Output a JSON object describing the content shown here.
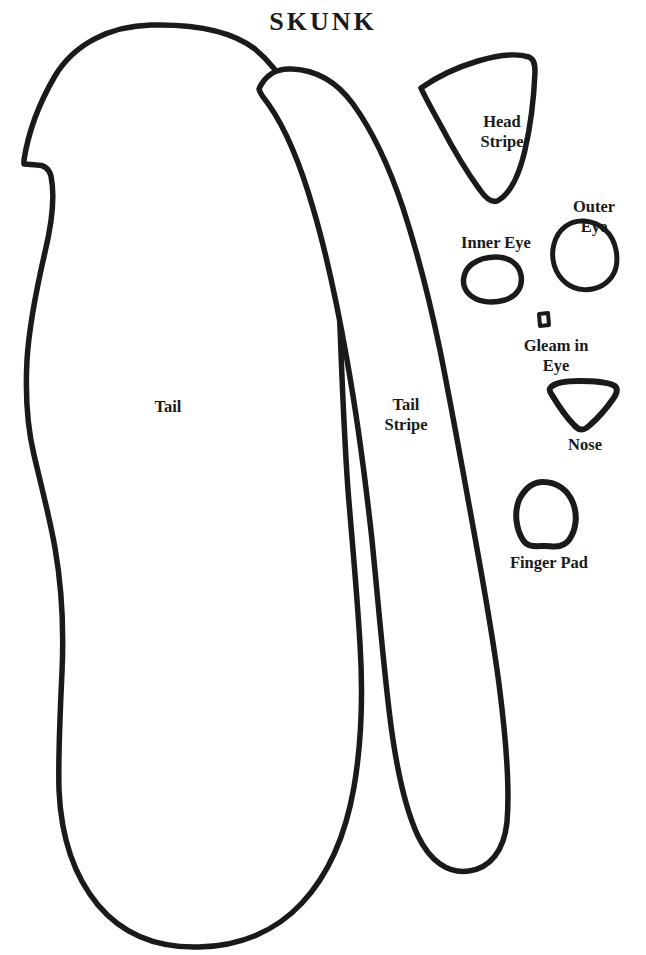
{
  "page": {
    "title": "SKUNK",
    "background_color": "#ffffff",
    "ink_color": "#1a1a1a",
    "width": 646,
    "height": 955
  },
  "pieces": [
    {
      "id": "tail",
      "label": "Tail",
      "label_x": 168,
      "label_y": 397,
      "stroke_width": 5.5,
      "icon": "tail-outline-shape",
      "path": "M 151 25 C 110 26 74 44 55 76 C 38 105 28 134 24 160 L 24 164 L 37 165 C 44 165 49 169 51 176 C 55 196 52 223 45 252 C 36 291 29 327 27 360 C 25 398 28 430 34 455 C 42 489 50 519 55 548 C 62 588 64 628 62 672 C 60 716 58 754 59 790 C 61 836 74 876 98 905 C 124 936 160 948 199 947 C 240 946 276 931 302 903 C 330 873 346 833 354 787 C 362 740 363 692 360 644 C 357 592 352 540 348 490 C 344 434 342 380 340 327 C 338 262 332 205 318 160 C 303 110 283 72 255 49 C 229 29 190 24 151 25 Z"
    },
    {
      "id": "tail-stripe",
      "label": "Tail\nStripe",
      "label_x": 406,
      "label_y": 395,
      "stroke_width": 5.5,
      "icon": "tail-stripe-outline-shape",
      "path": "M 259 89 C 265 75 277 68 292 69 C 316 70 337 82 353 104 C 374 133 390 169 403 208 C 418 254 430 302 440 350 C 452 410 462 466 472 521 C 482 576 492 630 499 684 C 506 738 510 786 507 822 C 504 851 490 868 469 871 C 448 874 430 861 418 836 C 404 806 396 766 390 718 C 383 661 378 600 372 540 C 365 476 357 416 347 360 C 337 303 326 252 313 208 C 300 163 285 128 269 105 C 264 98 260 94 259 89 Z"
    },
    {
      "id": "head-stripe",
      "label": "Head\nStripe",
      "label_x": 502,
      "label_y": 112,
      "stroke_width": 5.5,
      "icon": "head-stripe-outline-shape",
      "path": "M 421 88 C 438 76 458 67 478 61 C 498 55 516 53 529 57 C 534 59 535 64 535 72 C 534 96 531 124 525 150 C 519 176 510 193 499 200 C 493 204 487 200 480 190 C 466 171 452 147 440 124 C 430 106 424 95 421 88 Z"
    },
    {
      "id": "outer-eye",
      "label": "Outer Eye",
      "label_x": 594,
      "label_y": 197,
      "stroke_width": 5,
      "icon": "outer-eye-outline-shape",
      "path": "M 584 221 C 601 222 613 234 616 250 C 619 266 614 278 603 285 C 591 292 576 291 566 283 C 555 274 550 259 554 244 C 558 229 570 220 584 221 Z"
    },
    {
      "id": "inner-eye",
      "label": "Inner Eye",
      "label_x": 496,
      "label_y": 233,
      "stroke_width": 5.5,
      "icon": "inner-eye-outline-shape",
      "path": "M 496 257 C 509 257 519 264 521 275 C 523 287 517 296 505 300 C 491 304 476 302 468 293 C 461 285 462 272 472 264 C 479 259 488 257 496 257 Z"
    },
    {
      "id": "gleam-in-eye",
      "label": "Gleam in Eye",
      "label_x": 556,
      "label_y": 336,
      "stroke_width": 4,
      "icon": "gleam-in-eye-outline-shape",
      "path": "M 539 314 L 548 313 L 549 325 L 540 326 Z"
    },
    {
      "id": "nose",
      "label": "Nose",
      "label_x": 585,
      "label_y": 435,
      "stroke_width": 6,
      "icon": "nose-outline-shape",
      "path": "M 551 387 C 556 382 566 381 579 381 C 593 381 606 382 613 385 C 618 387 618 392 613 399 C 606 409 597 419 590 425 C 584 431 579 431 574 425 C 566 417 558 405 552 395 C 549 391 549 389 551 387 Z"
    },
    {
      "id": "finger-pad",
      "label": "Finger Pad",
      "label_x": 549,
      "label_y": 553,
      "stroke_width": 6,
      "icon": "finger-pad-outline-shape",
      "path": "M 543 482 C 557 482 568 490 573 503 C 578 516 576 530 569 540 C 562 549 553 546 545 546 C 536 546 528 548 523 540 C 516 529 514 513 519 500 C 525 488 533 482 543 482 Z"
    }
  ]
}
